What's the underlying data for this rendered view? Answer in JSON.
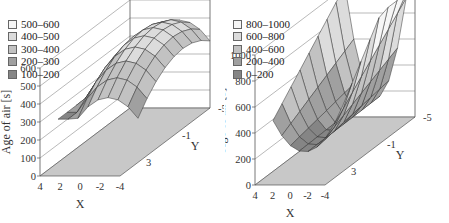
{
  "chart_data": [
    {
      "type": "surface3d",
      "title": "",
      "zlabel": "Age of air [s]",
      "xlabel": "X",
      "ylabel": "Y",
      "xlim": [
        4,
        -4
      ],
      "ylim": [
        5,
        -5
      ],
      "zlim": [
        0,
        600
      ],
      "xticks": [
        "4",
        "2",
        "0",
        "-2",
        "-4"
      ],
      "yticks": [
        "3",
        "-1",
        "-5"
      ],
      "zticks": [
        "0",
        "100",
        "200",
        "300",
        "400",
        "500",
        "600"
      ],
      "zticks_values": [
        0,
        100,
        200,
        300,
        400,
        500,
        600
      ],
      "legend": {
        "placement": "top-left",
        "entries": [
          {
            "label": "500–600",
            "color": "#f6f6f6"
          },
          {
            "label": "400–500",
            "color": "#dcdcdc"
          },
          {
            "label": "300–400",
            "color": "#c2c2c2"
          },
          {
            "label": "200–300",
            "color": "#a0a0a0"
          },
          {
            "label": "100–200",
            "color": "#858585"
          }
        ]
      },
      "surface": {
        "description": "Dome-shaped surface, maximum ~560 s near X≈0..-2, Y≈-1..-5; minimum ~230 s at X=4 edge and Y=3 edge",
        "grid_x": [
          4,
          3,
          2,
          1,
          0,
          -1,
          -2,
          -3,
          -4
        ],
        "grid_y": [
          3,
          2,
          1,
          0,
          -1,
          -2,
          -3,
          -4,
          -5
        ],
        "model": "dome",
        "peak": 560,
        "base": 240
      }
    },
    {
      "type": "surface3d",
      "title": "",
      "zlabel": "Age of air [s]",
      "xlabel": "X",
      "ylabel": "Y",
      "xlim": [
        4,
        -4
      ],
      "ylim": [
        5,
        -5
      ],
      "zlim": [
        0,
        1000
      ],
      "xticks": [
        "4",
        "2",
        "0",
        "-2",
        "-4"
      ],
      "yticks": [
        "3",
        "-1",
        "-5"
      ],
      "zticks": [
        "0",
        "200",
        "400",
        "600",
        "800",
        "1000"
      ],
      "zticks_values": [
        0,
        200,
        400,
        600,
        800,
        1000
      ],
      "legend": {
        "placement": "top-left",
        "entries": [
          {
            "label": "800–1000",
            "color": "#f6f6f6"
          },
          {
            "label": "600–800",
            "color": "#dcdcdc"
          },
          {
            "label": "400–600",
            "color": "#c2c2c2"
          },
          {
            "label": "200–400",
            "color": "#a0a0a0"
          },
          {
            "label": "0–200",
            "color": "#858585"
          }
        ]
      },
      "surface": {
        "description": "Saddle/valley surface: ~1000 s at corner X=4,Y=-5 side, dips to ~150 s near center, rises to ~1000 s at X=-4,Y=-5 far corner",
        "grid_x": [
          4,
          3,
          2,
          1,
          0,
          -1,
          -2,
          -3,
          -4
        ],
        "grid_y": [
          3,
          2,
          1,
          0,
          -1,
          -2,
          -3,
          -4,
          -5
        ],
        "model": "valley",
        "peak": 1000,
        "base": 150
      }
    }
  ]
}
